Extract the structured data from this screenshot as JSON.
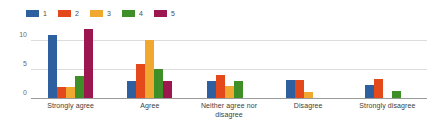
{
  "chart_data": {
    "type": "bar",
    "title": "",
    "subtitle": "",
    "xlabel": "",
    "ylabel": "",
    "grid": true,
    "legend_position": "top-left",
    "categories": [
      "Strongly agree",
      "Agree",
      "Neither agree nor disagree",
      "Disagree",
      "Strongly disagree"
    ],
    "ylim": [
      0,
      12.5
    ],
    "yticks": [
      0,
      5,
      10
    ],
    "ytick_labels": [
      "0",
      "5",
      "10"
    ],
    "series": [
      {
        "name": "1",
        "color": "#2e5f9e",
        "values": [
          11,
          3,
          3,
          3.2,
          2.4
        ]
      },
      {
        "name": "2",
        "color": "#e4491c",
        "values": [
          2,
          6,
          4.1,
          3.2,
          3.4
        ]
      },
      {
        "name": "3",
        "color": "#f0a830",
        "values": [
          2.1,
          10.1,
          2.2,
          1.2,
          0
        ]
      },
      {
        "name": "4",
        "color": "#3f8f29",
        "values": [
          4,
          5.1,
          3.1,
          0,
          1.3
        ]
      },
      {
        "name": "5",
        "color": "#9c1750",
        "values": [
          12,
          3.1,
          0,
          0,
          0
        ]
      }
    ]
  },
  "legend": {
    "items": [
      {
        "label": "1",
        "color": "#2e5f9e"
      },
      {
        "label": "2",
        "color": "#e4491c"
      },
      {
        "label": "3",
        "color": "#f0a830"
      },
      {
        "label": "4",
        "color": "#3f8f29"
      },
      {
        "label": "5",
        "color": "#9c1750"
      }
    ]
  }
}
